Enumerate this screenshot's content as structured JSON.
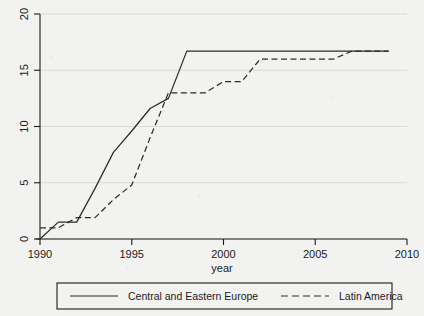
{
  "chart_data": {
    "type": "line",
    "title": "",
    "subtitle": "",
    "xlabel": "year",
    "ylabel": "",
    "xlim": [
      1990,
      2010
    ],
    "ylim": [
      0,
      20
    ],
    "xticks": [
      1990,
      1995,
      2000,
      2005,
      2010
    ],
    "xtick_labels": [
      "1990",
      "1995",
      "2000",
      "2005",
      "2010"
    ],
    "yticks": [
      0,
      5,
      10,
      15,
      20
    ],
    "ytick_labels": [
      "0",
      "5",
      "10",
      "15",
      "20"
    ],
    "grid": "horizontal",
    "legend_position": "bottom",
    "series": [
      {
        "name": "Central and Eastern Europe",
        "style": "solid",
        "color": "#2b2b2b",
        "x": [
          1990,
          1991,
          1992,
          1993,
          1994,
          1995,
          1996,
          1997,
          1998,
          1999,
          2000,
          2001,
          2002,
          2003,
          2004,
          2005,
          2006,
          2007,
          2008,
          2009
        ],
        "values": [
          0,
          1.5,
          1.5,
          4.5,
          7.7,
          9.6,
          11.6,
          12.5,
          16.7,
          16.7,
          16.7,
          16.7,
          16.7,
          16.7,
          16.7,
          16.7,
          16.7,
          16.7,
          16.7,
          16.7
        ]
      },
      {
        "name": "Latin America",
        "style": "dashed",
        "color": "#2b2b2b",
        "x": [
          1990,
          1991,
          1992,
          1993,
          1994,
          1995,
          1996,
          1997,
          1998,
          1999,
          2000,
          2001,
          2002,
          2003,
          2004,
          2005,
          2006,
          2007,
          2008,
          2009
        ],
        "values": [
          1.0,
          1.0,
          1.9,
          1.9,
          3.5,
          4.8,
          9.0,
          13.0,
          13.0,
          13.0,
          14.0,
          14.0,
          16.0,
          16.0,
          16.0,
          16.0,
          16.0,
          16.7,
          16.7,
          16.7
        ]
      }
    ],
    "legend": [
      {
        "label": "Central and Eastern Europe",
        "style": "solid"
      },
      {
        "label": "Latin America",
        "style": "dashed"
      }
    ]
  },
  "colors": {
    "background": "#f2f2f0",
    "axis": "#1a1a1a",
    "grid": "#d7d7d5",
    "line": "#2b2b2b",
    "text": "#1a1a1a",
    "legend_border": "#1a1a1a"
  }
}
